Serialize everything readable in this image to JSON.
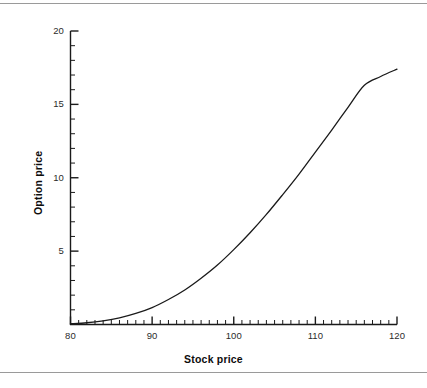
{
  "chart_data": {
    "type": "line",
    "title": "",
    "xlabel": "Stock price",
    "ylabel": "Option price",
    "xlim": [
      80,
      120
    ],
    "ylim": [
      0,
      20
    ],
    "xticks": [
      80,
      90,
      100,
      110,
      120
    ],
    "xtick_labels": [
      "80",
      "90",
      "100",
      "110",
      "120"
    ],
    "yticks": [
      5,
      10,
      15,
      20
    ],
    "ytick_labels": [
      "5",
      "10",
      "15",
      "20"
    ],
    "x_minor_tick_step": 1,
    "y_minor_tick_step": 1,
    "grid": false,
    "legend": "none",
    "line_color": "#1a1a1a",
    "series": [
      {
        "name": "Option price",
        "x": [
          80,
          82,
          84,
          86,
          88,
          90,
          92,
          94,
          96,
          98,
          100,
          102,
          104,
          106,
          108,
          110,
          112,
          114,
          116,
          118,
          120
        ],
        "values": [
          0.05,
          0.12,
          0.25,
          0.45,
          0.75,
          1.15,
          1.7,
          2.35,
          3.15,
          4.05,
          5.1,
          6.25,
          7.5,
          8.85,
          10.25,
          11.75,
          13.25,
          14.8,
          16.3,
          16.9,
          17.4
        ]
      }
    ]
  },
  "axes": {
    "x_title": "Stock price",
    "y_title": "Option price"
  },
  "colors": {
    "line": "#1a1a1a",
    "axis": "#1a1a1a",
    "rule": "#9a9a9a",
    "background": "#ffffff"
  }
}
